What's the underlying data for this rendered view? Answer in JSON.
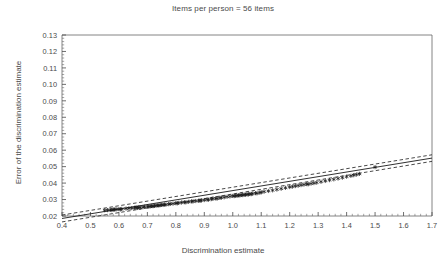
{
  "chart_data": {
    "type": "scatter",
    "title": "Items per person = 56 items",
    "xlabel": "Discrimination estimate",
    "ylabel": "Error of the discrimination estimate",
    "xlim": [
      0.4,
      1.7
    ],
    "ylim": [
      0.02,
      0.13
    ],
    "xticks": [
      0.4,
      0.5,
      0.6,
      0.7,
      0.8,
      0.9,
      1.0,
      1.1,
      1.2,
      1.3,
      1.4,
      1.5,
      1.6,
      1.7
    ],
    "xticklabels": [
      "0.4",
      "0.5",
      "0.6",
      "0.7",
      "0.8",
      "0.9",
      "1.0",
      "1.1",
      "1.2",
      "1.3",
      "1.4",
      "1.5",
      "1.6",
      "1.7"
    ],
    "yticks": [
      0.02,
      0.03,
      0.04,
      0.05,
      0.06,
      0.07,
      0.08,
      0.09,
      0.1,
      0.11,
      0.12,
      0.13
    ],
    "yticklabels": [
      "0.02",
      "0.03",
      "0.04",
      "0.05",
      "0.06",
      "0.07",
      "0.08",
      "0.09",
      "0.10",
      "0.11",
      "0.12",
      "0.13"
    ],
    "minor_ticks_per_interval": 5,
    "grid": false,
    "legend": "none",
    "marker": "asterisk",
    "marker_color": "#1a1a1a",
    "line_color": "#1a1a1a",
    "series": [
      {
        "name": "Items (56) per person",
        "marker": "asterisk",
        "x": [
          0.55,
          0.56,
          0.57,
          0.575,
          0.58,
          0.585,
          0.59,
          0.6,
          0.605,
          0.61,
          0.625,
          0.635,
          0.645,
          0.655,
          0.66,
          0.665,
          0.67,
          0.675,
          0.685,
          0.69,
          0.7,
          0.705,
          0.71,
          0.715,
          0.72,
          0.725,
          0.73,
          0.735,
          0.74,
          0.745,
          0.75,
          0.755,
          0.76,
          0.765,
          0.775,
          0.78,
          0.79,
          0.8,
          0.805,
          0.81,
          0.82,
          0.83,
          0.835,
          0.845,
          0.855,
          0.86,
          0.87,
          0.88,
          0.885,
          0.89,
          0.9,
          0.91,
          0.915,
          0.925,
          0.93,
          0.94,
          0.945,
          0.955,
          0.96,
          0.97,
          0.98,
          0.99,
          1.0,
          1.005,
          1.01,
          1.015,
          1.02,
          1.025,
          1.03,
          1.035,
          1.04,
          1.045,
          1.05,
          1.055,
          1.06,
          1.065,
          1.07,
          1.08,
          1.085,
          1.095,
          1.1,
          1.11,
          1.125,
          1.14,
          1.155,
          1.17,
          1.185,
          1.2,
          1.21,
          1.22,
          1.23,
          1.24,
          1.25,
          1.26,
          1.265,
          1.275,
          1.285,
          1.295,
          1.31,
          1.325,
          1.34,
          1.355,
          1.37,
          1.385,
          1.4,
          1.415,
          1.425,
          1.435,
          1.445,
          1.5
        ],
        "y": [
          0.0235,
          0.0236,
          0.0238,
          0.0236,
          0.024,
          0.0239,
          0.0241,
          0.0242,
          0.024,
          0.0243,
          0.0245,
          0.0247,
          0.0248,
          0.025,
          0.0252,
          0.0249,
          0.0253,
          0.0251,
          0.0254,
          0.0256,
          0.0258,
          0.0257,
          0.0259,
          0.0261,
          0.026,
          0.0262,
          0.0263,
          0.0265,
          0.0264,
          0.0266,
          0.0268,
          0.0267,
          0.027,
          0.0269,
          0.0272,
          0.0274,
          0.0275,
          0.0278,
          0.0277,
          0.028,
          0.0282,
          0.0284,
          0.0283,
          0.0286,
          0.0289,
          0.0288,
          0.0291,
          0.0293,
          0.0292,
          0.0295,
          0.0297,
          0.03,
          0.0299,
          0.0303,
          0.0305,
          0.0307,
          0.0306,
          0.031,
          0.0312,
          0.0314,
          0.0317,
          0.0319,
          0.0322,
          0.0321,
          0.0324,
          0.0323,
          0.0326,
          0.0325,
          0.0328,
          0.0327,
          0.033,
          0.0329,
          0.0332,
          0.0331,
          0.0334,
          0.0333,
          0.0336,
          0.0339,
          0.0338,
          0.0342,
          0.0344,
          0.0348,
          0.0352,
          0.0356,
          0.0361,
          0.0366,
          0.0371,
          0.0376,
          0.0379,
          0.0382,
          0.0385,
          0.0388,
          0.0391,
          0.0394,
          0.0393,
          0.0397,
          0.04,
          0.0403,
          0.0408,
          0.0413,
          0.0418,
          0.0423,
          0.0428,
          0.0433,
          0.0439,
          0.0444,
          0.0448,
          0.0452,
          0.0456,
          0.0497
        ]
      }
    ],
    "fit_line": {
      "name": "regression line",
      "style": "solid",
      "x": [
        0.4,
        1.7
      ],
      "y": [
        0.0185,
        0.0552
      ]
    },
    "confidence_bands": [
      {
        "name": "upper confidence band",
        "style": "dashed",
        "x": [
          0.4,
          1.7
        ],
        "y": [
          0.0206,
          0.0572
        ]
      },
      {
        "name": "lower confidence band",
        "style": "dashed",
        "x": [
          0.4,
          1.7
        ],
        "y": [
          0.0164,
          0.0532
        ]
      }
    ]
  }
}
